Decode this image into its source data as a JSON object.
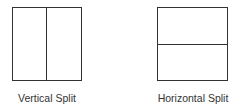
{
  "diagrams": [
    {
      "label": "Vertical Split",
      "orientation": "vertical"
    },
    {
      "label": "Horizontal Split",
      "orientation": "horizontal"
    }
  ],
  "colors": {
    "line": "#333333",
    "text": "#333333",
    "background": "#ffffff"
  }
}
